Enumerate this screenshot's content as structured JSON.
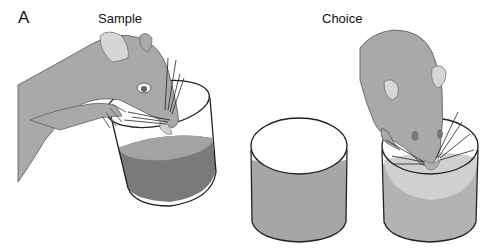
{
  "figure": {
    "panel_label": "A",
    "sections": [
      {
        "title": "Sample",
        "description": "Rat with paws on a tilted cup containing dark liquid, sniffing/drinking"
      },
      {
        "title": "Choice",
        "description": "Two cups: left cup untouched with medium-gray contents; right cup with rat head inserted, light-gray contents"
      }
    ]
  },
  "colors": {
    "rat_fill": "#a9a9a9",
    "rat_ear_inner": "#d6d6d6",
    "sample_liquid": "#7a7a7a",
    "sample_liquid_top": "#a0a0a0",
    "choice_left_liquid": "#a6a6a6",
    "choice_right_liquid": "#b3b3b3",
    "choice_right_liquid_top": "#d0d0d0",
    "outline": "#222222"
  }
}
